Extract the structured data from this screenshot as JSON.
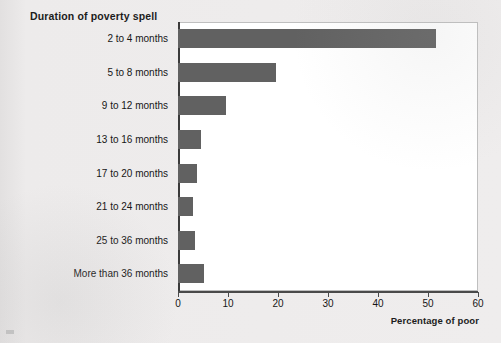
{
  "chart_data": {
    "type": "bar",
    "orientation": "horizontal",
    "title": "Duration of poverty spell",
    "xlabel": "Percentage of poor",
    "ylabel": "Duration of poverty spell",
    "categories": [
      "2 to 4 months",
      "5 to 8 months",
      "9 to 12 months",
      "13 to 16 months",
      "17 to 20 months",
      "21 to 24 months",
      "25 to 36 months",
      "More than 36 months"
    ],
    "values": [
      51.5,
      19.5,
      9.5,
      4.5,
      3.7,
      2.9,
      3.3,
      5.2
    ],
    "xlim": [
      0,
      60
    ],
    "xticks": [
      0,
      10,
      20,
      30,
      40,
      50,
      60
    ],
    "xtick_labels": [
      "0",
      "10",
      "20",
      "30",
      "40",
      "50",
      "60"
    ],
    "grid": false,
    "legend": "none",
    "bar_color": "#616161",
    "axis_color": "#3a3a3a",
    "plot_background": "#ffffff",
    "page_background": "#eceaea"
  }
}
